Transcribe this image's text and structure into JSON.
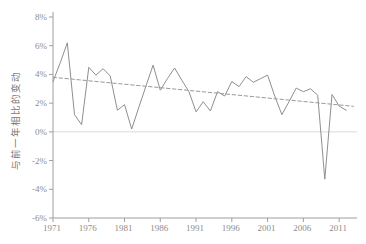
{
  "figure": {
    "background": "#ffffff"
  },
  "chart_data": {
    "type": "line",
    "title": "",
    "xlabel": "",
    "ylabel": "与前一年相比的变动",
    "ylim": [
      -6,
      8
    ],
    "xlim": [
      1971,
      2013.5
    ],
    "grid": "single light gridline at 0% only",
    "legend": "none",
    "x_tick_labels": [
      "1971",
      "1976",
      "1981",
      "1986",
      "1991",
      "1996",
      "2001",
      "2006",
      "2011"
    ],
    "x_tick_values": [
      1971,
      1976,
      1981,
      1986,
      1991,
      1996,
      2001,
      2006,
      2011
    ],
    "y_tick_labels": [
      "8%",
      "6%",
      "4%",
      "2%",
      "0%",
      "-2%",
      "-4%",
      "-6%"
    ],
    "y_tick_values": [
      8,
      6,
      4,
      2,
      0,
      -2,
      -4,
      -6
    ],
    "series": [
      {
        "name": "year-over-year-change",
        "style": "solid",
        "x": [
          1971,
          1972,
          1973,
          1974,
          1975,
          1976,
          1977,
          1978,
          1979,
          1980,
          1981,
          1982,
          1983,
          1984,
          1985,
          1986,
          1987,
          1988,
          1989,
          1990,
          1991,
          1992,
          1993,
          1994,
          1995,
          1996,
          1997,
          1998,
          1999,
          2000,
          2001,
          2002,
          2003,
          2004,
          2005,
          2006,
          2007,
          2008,
          2009,
          2010,
          2011,
          2012
        ],
        "values": [
          3.5,
          4.8,
          6.2,
          1.2,
          0.5,
          4.5,
          3.95,
          4.4,
          3.9,
          1.5,
          1.9,
          0.2,
          1.7,
          3.2,
          4.65,
          2.9,
          3.7,
          4.45,
          3.6,
          2.8,
          1.4,
          2.1,
          1.45,
          2.8,
          2.5,
          3.5,
          3.15,
          3.85,
          3.45,
          3.7,
          3.95,
          2.5,
          1.2,
          2.1,
          3.05,
          2.8,
          3.0,
          2.55,
          -3.3,
          2.6,
          1.8,
          1.5
        ]
      },
      {
        "name": "trend-line",
        "style": "dashed",
        "x": [
          1971,
          2013
        ],
        "values": [
          3.8,
          1.78
        ]
      }
    ],
    "colors": {
      "line": "#8f8f8f",
      "trend": "#9a9a9a",
      "axis": "#9e9e9e",
      "tick_label": "#8d8d8d",
      "zero_gridline": "#d9d9d9",
      "background": "#ffffff"
    }
  }
}
